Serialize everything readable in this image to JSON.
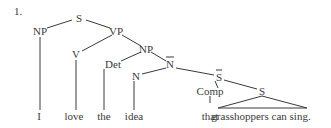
{
  "example_number": "1.",
  "nodes": {
    "s": {
      "label": "S",
      "x": 79,
      "y": 18
    },
    "np_subj": {
      "label": "NP",
      "x": 40,
      "y": 31
    },
    "vp": {
      "label": "VP",
      "x": 116,
      "y": 31
    },
    "v": {
      "label": "V",
      "x": 76,
      "y": 54
    },
    "np_obj": {
      "label": "NP",
      "x": 146,
      "y": 49
    },
    "det": {
      "label": "Det",
      "x": 113,
      "y": 64
    },
    "nbar": {
      "label": "N",
      "x": 170,
      "y": 64
    },
    "n": {
      "label": "N",
      "x": 136,
      "y": 76
    },
    "sbar": {
      "label": "S",
      "x": 219,
      "y": 77
    },
    "comp": {
      "label": "Comp",
      "x": 210,
      "y": 91
    },
    "s_inner": {
      "label": "S",
      "x": 262,
      "y": 91
    }
  },
  "leaves": {
    "i": {
      "label": "I",
      "x": 39,
      "y": 116
    },
    "love": {
      "label": "love",
      "x": 74,
      "y": 116
    },
    "the": {
      "label": "the",
      "x": 104,
      "y": 116
    },
    "idea": {
      "label": "idea",
      "x": 134,
      "y": 116
    },
    "that": {
      "label": "that",
      "x": 210,
      "y": 116
    },
    "clause": {
      "label": "grasshoppers can sing.",
      "x": 261,
      "y": 116
    }
  },
  "edges": [
    {
      "from": [
        72,
        20
      ],
      "to": [
        47,
        28
      ]
    },
    {
      "from": [
        86,
        20
      ],
      "to": [
        110,
        28
      ]
    },
    {
      "from": [
        112,
        35
      ],
      "to": [
        82,
        51
      ]
    },
    {
      "from": [
        122,
        35
      ],
      "to": [
        141,
        46
      ]
    },
    {
      "from": [
        141,
        52
      ],
      "to": [
        121,
        61
      ]
    },
    {
      "from": [
        151,
        52
      ],
      "to": [
        166,
        61
      ]
    },
    {
      "from": [
        166,
        68
      ],
      "to": [
        142,
        74
      ]
    },
    {
      "from": [
        176,
        68
      ],
      "to": [
        214,
        75
      ]
    },
    {
      "from": [
        215,
        81
      ],
      "to": [
        218,
        88
      ]
    },
    {
      "from": [
        224,
        80
      ],
      "to": [
        257,
        89
      ]
    },
    {
      "from": [
        40,
        37
      ],
      "to": [
        40,
        110
      ]
    },
    {
      "from": [
        76,
        60
      ],
      "to": [
        76,
        110
      ]
    },
    {
      "from": [
        104,
        69
      ],
      "to": [
        104,
        110
      ]
    },
    {
      "from": [
        134,
        81
      ],
      "to": [
        134,
        110
      ]
    },
    {
      "from": [
        210,
        96
      ],
      "to": [
        210,
        103
      ]
    }
  ],
  "triangle": {
    "apex": [
      262,
      96
    ],
    "left": [
      218,
      108
    ],
    "right": [
      307,
      108
    ]
  }
}
